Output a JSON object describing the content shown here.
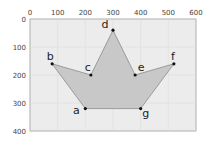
{
  "chart_data": {
    "type": "scatter",
    "title": "",
    "xlabel": "",
    "ylabel": "",
    "xlim": [
      0,
      600
    ],
    "ylim": [
      400,
      0
    ],
    "y_inverted": true,
    "grid": true,
    "x_ticks": [
      0,
      100,
      200,
      300,
      400,
      500,
      600
    ],
    "y_ticks": [
      0,
      100,
      200,
      300,
      400
    ],
    "x_tick_labels": [
      "0",
      "100",
      "200",
      "300",
      "400",
      "500",
      "600"
    ],
    "y_tick_labels": [
      "0",
      "100",
      "200",
      "300",
      "400"
    ],
    "polygon_fill": "#c8c8c8",
    "polygon_stroke": "#8a8a8a",
    "plot_background": "#ececec",
    "points": [
      {
        "label": "a",
        "x": 200,
        "y": 320
      },
      {
        "label": "b",
        "x": 80,
        "y": 160
      },
      {
        "label": "c",
        "x": 220,
        "y": 200
      },
      {
        "label": "d",
        "x": 300,
        "y": 40
      },
      {
        "label": "e",
        "x": 380,
        "y": 200
      },
      {
        "label": "f",
        "x": 520,
        "y": 160
      },
      {
        "label": "g",
        "x": 400,
        "y": 320
      }
    ],
    "polygon_order": [
      "a",
      "b",
      "c",
      "d",
      "e",
      "f",
      "g"
    ]
  }
}
